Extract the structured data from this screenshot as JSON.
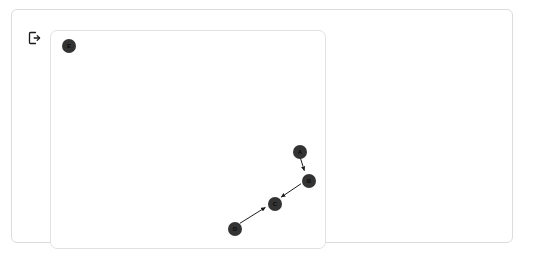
{
  "app": {
    "title": "Graph Canvas",
    "background_color": "#ffffff"
  },
  "toolbar": {
    "exit_icon": "exit-icon",
    "exit_label": "Exit"
  },
  "canvas": {
    "name": "graph-canvas",
    "background_color": "#ffffff",
    "border_color": "#e2e2e2",
    "width": 276,
    "height": 219
  },
  "graph": {
    "node_color": "#333333",
    "edge_color": "#1a1a1a",
    "node_radius": 7,
    "nodes": [
      {
        "id": "E",
        "label": "E",
        "x": 18,
        "y": 15,
        "r": 7
      },
      {
        "id": "A",
        "label": "A",
        "x": 249,
        "y": 121,
        "r": 7
      },
      {
        "id": "B",
        "label": "B",
        "x": 258,
        "y": 150,
        "r": 7
      },
      {
        "id": "C",
        "label": "C",
        "x": 224,
        "y": 173,
        "r": 7
      },
      {
        "id": "D",
        "label": "D",
        "x": 184,
        "y": 198,
        "r": 7
      }
    ],
    "edges": [
      {
        "from": "A",
        "to": "B",
        "directed": true
      },
      {
        "from": "B",
        "to": "C",
        "directed": true
      },
      {
        "from": "D",
        "to": "C",
        "directed": true
      }
    ]
  }
}
